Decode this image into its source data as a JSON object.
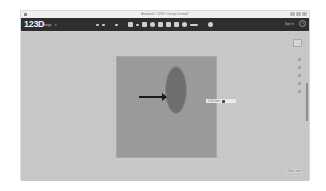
{
  "window": {
    "title": "Autodesk® 123D® Design Untitled*",
    "controls": [
      "–",
      "□",
      "×"
    ]
  },
  "toolbar": {
    "logo": "123D",
    "logo_sub": "Design",
    "logo_caret": "▾",
    "tools": [
      {
        "name": "undo-icon"
      },
      {
        "name": "redo-icon"
      },
      {
        "name": "transform-icon"
      },
      {
        "name": "primitives-icon"
      },
      {
        "name": "sketch-icon"
      },
      {
        "name": "construct-icon"
      },
      {
        "name": "modify-icon"
      },
      {
        "name": "pattern-icon"
      },
      {
        "name": "grouping-icon"
      },
      {
        "name": "combine-icon"
      },
      {
        "name": "measure-icon"
      },
      {
        "name": "text-icon"
      },
      {
        "name": "snap-icon"
      },
      {
        "name": "material-icon"
      }
    ],
    "sign_in": "Sign In",
    "help": "?"
  },
  "canvas": {
    "dimension_value": "0.00 mm",
    "grid_units": "Units: mm"
  },
  "colors": {
    "toolbar_bg": "#2e2e2e",
    "canvas_bg": "#c6c6c6",
    "plane": "#9a9a9a",
    "ellipse": "#6e6e6e",
    "arrow": "#1a1a1a"
  }
}
